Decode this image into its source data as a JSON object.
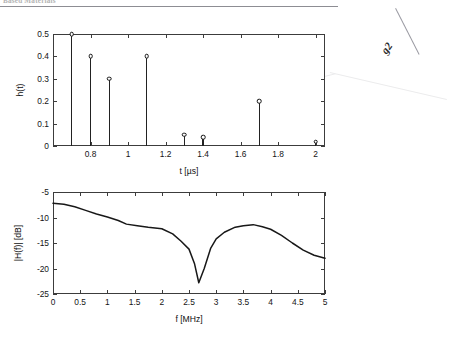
{
  "page": {
    "header_text": "Based Materials",
    "margin_mark": "g2"
  },
  "figure": {
    "panels": [
      {
        "id": "impulse-response",
        "chart_ref": 0
      },
      {
        "id": "frequency-response",
        "chart_ref": 1
      }
    ]
  },
  "chart_data": [
    {
      "type": "stem",
      "title": "",
      "xlabel": "t [µs]",
      "ylabel": "h(t)",
      "xlim": [
        0.6,
        2.05
      ],
      "ylim": [
        0,
        0.5
      ],
      "xticks": [
        0.8,
        1,
        1.2,
        1.4,
        1.6,
        1.8,
        2
      ],
      "xticklabels": [
        "0.8",
        "1",
        "1.2",
        "1.4",
        "1.6",
        "1.8",
        "2"
      ],
      "yticks": [
        0,
        0.1,
        0.2,
        0.3,
        0.4,
        0.5
      ],
      "yticklabels": [
        "0",
        "0.1",
        "0.2",
        "0.3",
        "0.4",
        "0.5"
      ],
      "grid": false,
      "legend": "none",
      "marker": "circle-open",
      "x": [
        0.7,
        0.8,
        0.9,
        1.1,
        1.3,
        1.4,
        1.7,
        2.0
      ],
      "values": [
        0.5,
        0.4,
        0.3,
        0.4,
        0.05,
        0.04,
        0.2,
        0.02
      ]
    },
    {
      "type": "line",
      "title": "",
      "xlabel": "f [MHz]",
      "ylabel": "|H(f)| [dB]",
      "xlim": [
        0,
        5
      ],
      "ylim": [
        -25,
        -5
      ],
      "xticks": [
        0,
        0.5,
        1,
        1.5,
        2,
        2.5,
        3,
        3.5,
        4,
        4.5,
        5
      ],
      "xticklabels": [
        "0",
        "0.5",
        "1",
        "1.5",
        "2",
        "2.5",
        "3",
        "3.5",
        "4",
        "4.5",
        "5"
      ],
      "yticks": [
        -25,
        -20,
        -15,
        -10,
        -5
      ],
      "yticklabels": [
        "-25",
        "-20",
        "-15",
        "-10",
        "-5"
      ],
      "grid": false,
      "legend": "none",
      "x": [
        0.0,
        0.2,
        0.4,
        0.6,
        0.8,
        1.0,
        1.2,
        1.35,
        1.55,
        1.75,
        2.0,
        2.2,
        2.35,
        2.5,
        2.6,
        2.68,
        2.78,
        2.9,
        3.0,
        3.15,
        3.35,
        3.5,
        3.68,
        3.85,
        4.0,
        4.2,
        4.4,
        4.6,
        4.8,
        5.0
      ],
      "values": [
        -7.2,
        -7.4,
        -7.9,
        -8.6,
        -9.3,
        -9.9,
        -10.6,
        -11.3,
        -11.6,
        -11.9,
        -12.2,
        -13.2,
        -14.6,
        -16.2,
        -19.0,
        -22.8,
        -20.0,
        -16.0,
        -14.2,
        -12.9,
        -11.9,
        -11.6,
        -11.4,
        -11.8,
        -12.3,
        -13.5,
        -15.0,
        -16.4,
        -17.4,
        -18.0
      ]
    }
  ]
}
